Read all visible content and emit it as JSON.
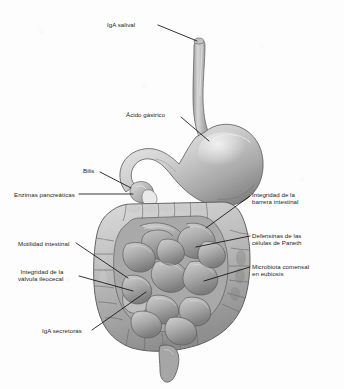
{
  "figure": {
    "type": "anatomical-illustration",
    "palette": {
      "background": "#fdfdfd",
      "organ_light": "#e8e8e8",
      "organ_mid": "#bdbdbd",
      "organ_dark": "#8a8a8a",
      "organ_shadow": "#6b6b6b",
      "outline": "#4a4a4a",
      "leader_line": "#111111",
      "label_text": "#1c1c1c"
    },
    "organs": [
      {
        "name": "esofago",
        "label_es": "Esófago"
      },
      {
        "name": "estomago",
        "label_es": "Estómago"
      },
      {
        "name": "duodeno",
        "label_es": "Duodeno"
      },
      {
        "name": "colon",
        "label_es": "Colon"
      },
      {
        "name": "intestino-delgado",
        "label_es": "Intestino delgado"
      },
      {
        "name": "ciego",
        "label_es": "Ciego"
      },
      {
        "name": "recto",
        "label_es": "Recto"
      }
    ]
  },
  "labels": [
    {
      "id": "iga-salival",
      "text": "IgA salival",
      "side": "left",
      "target": "esofago-superior",
      "text_x": 107,
      "text_y": 21,
      "line": [
        [
          158,
          25
        ],
        [
          197,
          41
        ]
      ]
    },
    {
      "id": "acido-gastrico",
      "text": "Ácido gástrico",
      "side": "left",
      "target": "estomago",
      "text_x": 126,
      "text_y": 111,
      "line": [
        [
          181,
          117
        ],
        [
          209,
          141
        ]
      ]
    },
    {
      "id": "bilis",
      "text": "Bilis",
      "side": "left",
      "target": "duodeno-superior",
      "text_x": 83,
      "text_y": 167,
      "line": [
        [
          100,
          172
        ],
        [
          131,
          188
        ]
      ]
    },
    {
      "id": "enzimas-pancreaticas",
      "text": "Enzimas pancreáticas",
      "side": "left",
      "target": "duodeno-pancreas",
      "text_x": 14,
      "text_y": 191,
      "line": [
        [
          79,
          194
        ],
        [
          133,
          194
        ]
      ]
    },
    {
      "id": "motilidad-intestinal",
      "text": "Motilidad intestinal",
      "side": "left",
      "target": "intestino-delgado-izq",
      "text_x": 18,
      "text_y": 240,
      "line": [
        [
          76,
          243
        ],
        [
          128,
          278
        ]
      ]
    },
    {
      "id": "integridad-valvula-ileocecal",
      "text": "Integridad de la\nválvula ileocecal",
      "side": "left",
      "target": "valvula-ileocecal",
      "text_x": 18,
      "text_y": 268,
      "line": [
        [
          79,
          276
        ],
        [
          133,
          291
        ]
      ]
    },
    {
      "id": "iga-secretoras",
      "text": "IgA secretoras",
      "side": "left",
      "target": "intestino-delgado-centro",
      "text_x": 42,
      "text_y": 327,
      "line": [
        [
          92,
          330
        ],
        [
          146,
          292
        ]
      ]
    },
    {
      "id": "integridad-barrera-intestinal",
      "text": "Integridad de la\nbarrera intestinal",
      "side": "right",
      "target": "colon-transverso-der",
      "text_x": 252,
      "text_y": 191,
      "line": [
        [
          250,
          196
        ],
        [
          206,
          228
        ]
      ]
    },
    {
      "id": "defensinas-celulas-paneth",
      "text": "Defensinas de las\ncélulas de Paneth",
      "side": "right",
      "target": "intestino-delgado-der",
      "text_x": 252,
      "text_y": 232,
      "line": [
        [
          250,
          236
        ],
        [
          196,
          247
        ]
      ]
    },
    {
      "id": "microbiota-comensal-eubiosis",
      "text": "Microbiota comensal\nen eubiosis",
      "side": "right",
      "target": "colon-descendente",
      "text_x": 252,
      "text_y": 263,
      "line": [
        [
          250,
          267
        ],
        [
          204,
          281
        ]
      ]
    }
  ]
}
